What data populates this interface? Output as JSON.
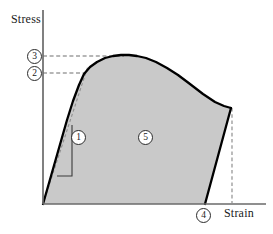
{
  "figure": {
    "background_color": "#ffffff"
  },
  "axes": {
    "y_label": "Stress",
    "x_label": "Strain",
    "axis_color": "#5a5a5a",
    "origin_px": [
      43,
      204
    ],
    "y_axis_top_px": [
      43,
      10
    ],
    "x_axis_right_px": [
      266,
      204
    ]
  },
  "markers": [
    {
      "id": "1",
      "label": "1",
      "meaning": "elastic-modulus-slope",
      "x": 71,
      "y": 130
    },
    {
      "id": "2",
      "label": "2",
      "meaning": "yield-strength",
      "x": 27,
      "y": 66
    },
    {
      "id": "3",
      "label": "3",
      "meaning": "ultimate-tensile-strength",
      "x": 27,
      "y": 49
    },
    {
      "id": "4",
      "label": "4",
      "meaning": "fracture-strain",
      "x": 196,
      "y": 208
    },
    {
      "id": "5",
      "label": "5",
      "meaning": "toughness-area-under-curve",
      "x": 138,
      "y": 130
    }
  ],
  "chart_data": {
    "type": "line",
    "xlabel": "Strain",
    "ylabel": "Stress",
    "grid": false,
    "legend": "none",
    "axis_ticks": "none",
    "curve_color": "#000000",
    "fill_color": "#c9c9c9",
    "dashed_color": "#8a8a8a",
    "series": [
      {
        "name": "engineering-stress-strain-curve",
        "description": "Elastic rise, yield knee, strain hardening to ultimate strength, necking, then fracture drop",
        "points_px": [
          [
            43,
            204
          ],
          [
            49,
            183
          ],
          [
            55,
            162
          ],
          [
            61,
            141
          ],
          [
            67,
            120
          ],
          [
            73,
            101
          ],
          [
            79,
            85
          ],
          [
            84,
            74
          ],
          [
            90,
            67
          ],
          [
            97,
            62
          ],
          [
            105,
            58
          ],
          [
            113,
            56
          ],
          [
            121,
            55
          ],
          [
            129,
            55
          ],
          [
            137,
            56
          ],
          [
            146,
            58
          ],
          [
            156,
            62
          ],
          [
            167,
            68
          ],
          [
            178,
            75
          ],
          [
            190,
            84
          ],
          [
            203,
            94
          ],
          [
            215,
            102
          ],
          [
            224,
            106
          ],
          [
            231,
            108
          ]
        ]
      },
      {
        "name": "fracture-drop",
        "description": "Abrupt load drop at fracture from necked stress back to the strain axis",
        "points_px": [
          [
            231,
            108
          ],
          [
            205,
            204
          ]
        ]
      }
    ],
    "annotations": [
      {
        "name": "elastic-line",
        "style": "dashed",
        "description": "Linear elastic extrapolation of initial slope",
        "points_px": [
          [
            43,
            204
          ],
          [
            88,
            66
          ]
        ]
      },
      {
        "name": "ultimate-strength-gridline",
        "style": "dashed",
        "description": "Horizontal reference from y-axis to ultimate tensile strength",
        "points_px": [
          [
            43,
            56
          ],
          [
            124,
            56
          ]
        ]
      },
      {
        "name": "yield-strength-gridline",
        "style": "dashed",
        "description": "Horizontal reference from y-axis to yield point",
        "points_px": [
          [
            43,
            73
          ],
          [
            86,
            73
          ]
        ]
      },
      {
        "name": "fracture-strain-gridline",
        "style": "dashed",
        "description": "Vertical reference from necked fracture point down to strain axis",
        "points_px": [
          [
            232,
            108
          ],
          [
            232,
            204
          ]
        ]
      },
      {
        "name": "slope-triangle",
        "style": "solid",
        "description": "Rise-over-run triangle indicating modulus of elasticity",
        "points_px": [
          [
            57,
            176
          ],
          [
            72,
            176
          ],
          [
            72,
            125
          ]
        ]
      }
    ],
    "shaded_region": {
      "name": "toughness-area",
      "description": "Total area under the stress-strain curve up to fracture",
      "color": "#c9c9c9"
    }
  }
}
